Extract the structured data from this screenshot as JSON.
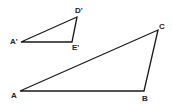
{
  "diagram": {
    "line_color": "#1a1a1a",
    "small_triangle": {
      "vertices": [
        {
          "label": "A'",
          "x": 21,
          "y": 42,
          "lx": 10,
          "ly": 44
        },
        {
          "label": "D'",
          "x": 77,
          "y": 17,
          "lx": 75,
          "ly": 13
        },
        {
          "label": "E'",
          "x": 72,
          "y": 42,
          "lx": 72,
          "ly": 50
        }
      ]
    },
    "large_triangle": {
      "vertices": [
        {
          "label": "A",
          "x": 20,
          "y": 91,
          "lx": 11,
          "ly": 98
        },
        {
          "label": "B",
          "x": 144,
          "y": 91,
          "lx": 142,
          "ly": 101
        },
        {
          "label": "C",
          "x": 158,
          "y": 30,
          "lx": 159,
          "ly": 29
        }
      ]
    }
  }
}
